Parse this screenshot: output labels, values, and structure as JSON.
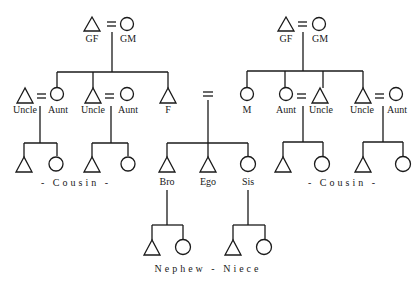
{
  "diagram": {
    "type": "kinship-chart",
    "paternal": {
      "grandparents": {
        "male": "GF",
        "female": "GM"
      },
      "children": [
        {
          "label": "Uncle",
          "spouse": "Aunt"
        },
        {
          "label": "Uncle",
          "spouse": "Aunt"
        },
        {
          "label": "F"
        }
      ],
      "cousins_label": "- Cousin -"
    },
    "maternal": {
      "grandparents": {
        "male": "GF",
        "female": "GM"
      },
      "children": [
        {
          "label": "M"
        },
        {
          "label": "Aunt",
          "spouse": "Uncle"
        },
        {
          "label": "Uncle",
          "spouse": "Aunt"
        }
      ],
      "cousins_label": "- Cousin -"
    },
    "siblings": [
      {
        "label": "Bro"
      },
      {
        "label": "Ego"
      },
      {
        "label": "Sis"
      }
    ],
    "nephew_niece_label": "Nephew - Niece"
  }
}
